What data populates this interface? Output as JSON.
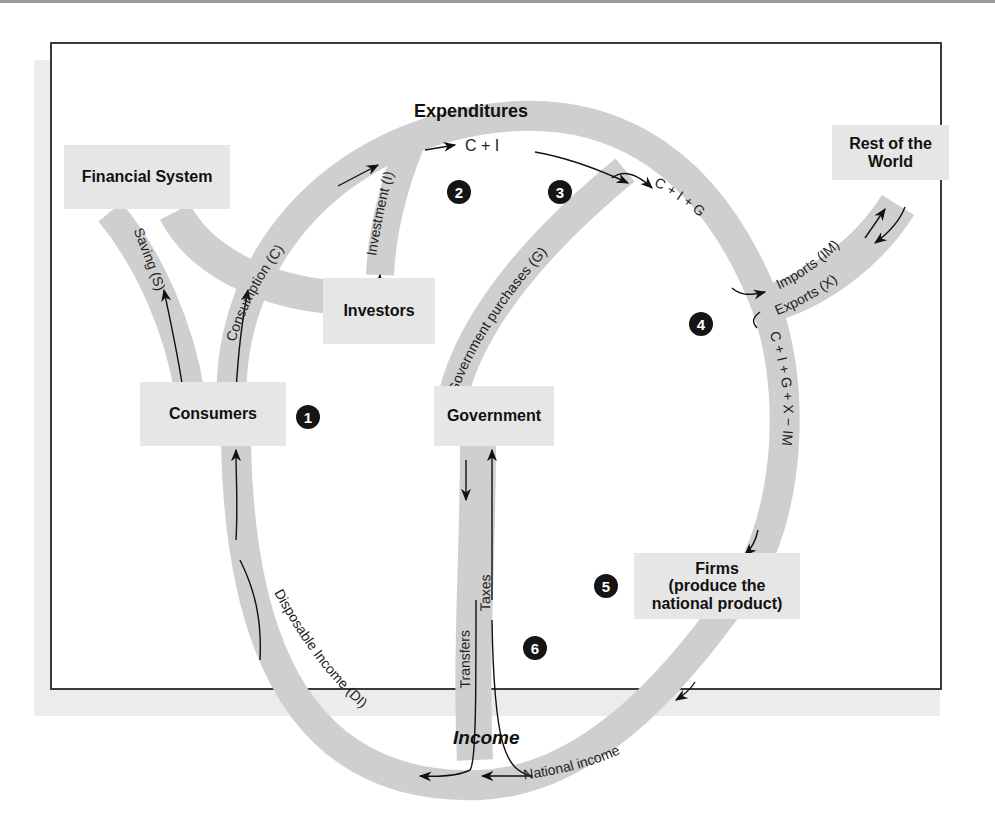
{
  "diagram": {
    "type": "circular-flow",
    "section_labels": {
      "top": "Expenditures",
      "bottom": "Income"
    },
    "nodes": {
      "financial_system": "Financial System",
      "investors": "Investors",
      "consumers": "Consumers",
      "government": "Government",
      "rest_of_world_line1": "Rest of the",
      "rest_of_world_line2": "World",
      "firms_line1": "Firms",
      "firms_line2": "(produce the",
      "firms_line3": "national product)"
    },
    "flows": {
      "saving": "Saving (S)",
      "consumption": "Consumption (C)",
      "investment": "Investment (I)",
      "c_plus_i": "C + I",
      "government_purchases": "Government purchases (G)",
      "c_plus_i_plus_g": "C + I + G",
      "imports": "Imports (IM)",
      "exports": "Exports (X)",
      "total_expenditure": "C + I + G + X − IM",
      "national_income": "National income",
      "taxes": "Taxes",
      "transfers": "Transfers",
      "disposable_income": "Disposable Income (DI)"
    },
    "badges": [
      "1",
      "2",
      "3",
      "4",
      "5",
      "6"
    ],
    "colors": {
      "pipe": "#cfcfcf",
      "box": "#e6e6e6",
      "badge": "#151515",
      "frame": "#3a3a3a"
    }
  }
}
